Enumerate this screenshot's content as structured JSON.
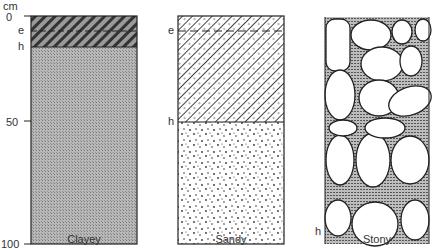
{
  "axis": {
    "unit": "cm",
    "ticks": [
      "0",
      "50",
      "100"
    ]
  },
  "profiles": [
    {
      "name": "Clayey",
      "horizon_labels": [
        "e",
        "h"
      ],
      "layers": [
        {
          "label": "e",
          "pattern": "dark-diagonal-hatch"
        },
        {
          "label": "h",
          "pattern": "fine-gray-stipple"
        }
      ]
    },
    {
      "name": "Sandy",
      "horizon_labels": [
        "e",
        "h"
      ],
      "layers": [
        {
          "label": "e",
          "pattern": "diagonal-hatch-with-dots"
        },
        {
          "label": "h",
          "pattern": "scattered-dots"
        }
      ]
    },
    {
      "name": "Stony",
      "horizon_labels": [
        "h"
      ],
      "layers": [
        {
          "label": "h",
          "pattern": "rounded-stones-with-shaded-gaps"
        }
      ]
    }
  ],
  "colors": {
    "outline": "#222222",
    "clay_fill": "#a9a9a9",
    "hatch": "#333333",
    "gap_fill": "#8a8a8a"
  }
}
